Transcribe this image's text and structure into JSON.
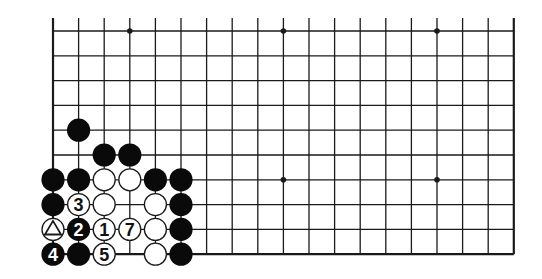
{
  "diagram": {
    "type": "go-board-partial",
    "board": {
      "columns": 19,
      "visible_rows": 10,
      "edges": {
        "left": true,
        "right": true,
        "bottom": true,
        "top": false
      },
      "star_points": [
        [
          3,
          0
        ],
        [
          9,
          0
        ],
        [
          15,
          0
        ],
        [
          9,
          6
        ],
        [
          15,
          6
        ]
      ]
    },
    "stones": [
      {
        "col": 1,
        "row": 4,
        "color": "black",
        "label": ""
      },
      {
        "col": 2,
        "row": 5,
        "color": "black",
        "label": ""
      },
      {
        "col": 3,
        "row": 5,
        "color": "black",
        "label": ""
      },
      {
        "col": 0,
        "row": 6,
        "color": "black",
        "label": ""
      },
      {
        "col": 1,
        "row": 6,
        "color": "black",
        "label": ""
      },
      {
        "col": 2,
        "row": 6,
        "color": "white",
        "label": ""
      },
      {
        "col": 3,
        "row": 6,
        "color": "white",
        "label": ""
      },
      {
        "col": 4,
        "row": 6,
        "color": "black",
        "label": ""
      },
      {
        "col": 5,
        "row": 6,
        "color": "black",
        "label": ""
      },
      {
        "col": 0,
        "row": 7,
        "color": "black",
        "label": ""
      },
      {
        "col": 1,
        "row": 7,
        "color": "white",
        "label": "3"
      },
      {
        "col": 2,
        "row": 7,
        "color": "white",
        "label": ""
      },
      {
        "col": 4,
        "row": 7,
        "color": "white",
        "label": ""
      },
      {
        "col": 5,
        "row": 7,
        "color": "black",
        "label": ""
      },
      {
        "col": 0,
        "row": 8,
        "color": "white",
        "label": "",
        "marker": "triangle"
      },
      {
        "col": 1,
        "row": 8,
        "color": "black",
        "label": "2"
      },
      {
        "col": 2,
        "row": 8,
        "color": "white",
        "label": "1"
      },
      {
        "col": 3,
        "row": 8,
        "color": "white",
        "label": "7"
      },
      {
        "col": 4,
        "row": 8,
        "color": "white",
        "label": ""
      },
      {
        "col": 5,
        "row": 8,
        "color": "black",
        "label": ""
      },
      {
        "col": 0,
        "row": 9,
        "color": "black",
        "label": "4"
      },
      {
        "col": 1,
        "row": 9,
        "color": "black",
        "label": ""
      },
      {
        "col": 2,
        "row": 9,
        "color": "white",
        "label": "5"
      },
      {
        "col": 4,
        "row": 9,
        "color": "white",
        "label": ""
      },
      {
        "col": 5,
        "row": 9,
        "color": "black",
        "label": ""
      }
    ],
    "colors": {
      "line": "#1a1a1a",
      "black_stone": "#0a0a0a",
      "white_stone": "#ffffff",
      "background": "#ffffff"
    }
  }
}
